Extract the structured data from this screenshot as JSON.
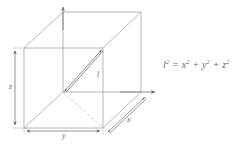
{
  "figure": {
    "background_color": "#ffffff",
    "line_color": "#8c8c8c",
    "text_color": "#6e6e6e",
    "dimensions": {
      "width": 240,
      "height": 148
    }
  },
  "labels": {
    "z": "z",
    "y": "y",
    "x": "x",
    "diagonal": "l"
  },
  "equation": {
    "lhs_base": "l",
    "lhs_exp": "2",
    "equals": "=",
    "term1_base": "x",
    "term1_exp": "2",
    "plus1": "+",
    "term2_base": "y",
    "term2_exp": "2",
    "plus2": "+",
    "term3_base": "z",
    "term3_exp": "2",
    "full_text": "l² = x² + y² + z²"
  },
  "geometry": {
    "type": "cube-oblique-projection",
    "origin": {
      "x": 63,
      "y": 92
    },
    "front_face": {
      "top_left": {
        "x": 24,
        "y": 48
      },
      "top_right": {
        "x": 103,
        "y": 48
      },
      "bottom_left": {
        "x": 24,
        "y": 128
      },
      "bottom_right": {
        "x": 103,
        "y": 128
      }
    },
    "back_face": {
      "top_left": {
        "x": 63,
        "y": 12
      },
      "top_right": {
        "x": 141,
        "y": 12
      },
      "bottom_left": {
        "x": 63,
        "y": 92
      },
      "bottom_right": {
        "x": 141,
        "y": 92
      }
    },
    "diagonal_from": {
      "x": 63,
      "y": 92
    },
    "diagonal_to": {
      "x": 103,
      "y": 48
    },
    "axes": {
      "z_axis_arrow_tip": {
        "x": 63,
        "y": 8
      },
      "x_axis_arrow_tip": {
        "x": 155,
        "y": 92
      }
    },
    "dimension_lines": {
      "z": {
        "x": 15,
        "y_from": 48,
        "y_to": 128
      },
      "y": {
        "y": 138,
        "x_from": 24,
        "x_to": 103
      },
      "x": {
        "from": {
          "x": 106,
          "y": 131
        },
        "to": {
          "x": 145,
          "y": 95
        }
      }
    }
  }
}
